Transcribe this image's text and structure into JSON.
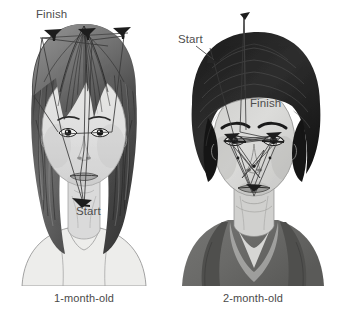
{
  "figure": {
    "background_color": "#ffffff",
    "ink_color": "#1a1a1a",
    "label_color": "#4e4e4e",
    "scanpath_color": "#3a3a3a"
  },
  "panels": [
    {
      "id": "one-month-old",
      "caption": "1-month-old",
      "subject": "woman with long dark hair, frontal view",
      "labels": {
        "finish": "Finish",
        "start": "Start"
      },
      "scanpath": {
        "description": "Fixations concentrated along the outer contour and hairline; few internal features scanned.",
        "start_region": "chin / neck",
        "finish_region": "top hairline",
        "fixation_markers": 3
      }
    },
    {
      "id": "two-month-old",
      "caption": "2-month-old",
      "subject": "man with dark wavy hair, three-quarter frontal view",
      "labels": {
        "start": "Start",
        "finish": "Finish"
      },
      "scanpath": {
        "description": "Dense fixation cluster over the internal features, especially the eyes.",
        "start_region": "above the head / upper hair",
        "finish_region": "right eye / eyebrow",
        "fixation_markers": 9
      }
    }
  ]
}
